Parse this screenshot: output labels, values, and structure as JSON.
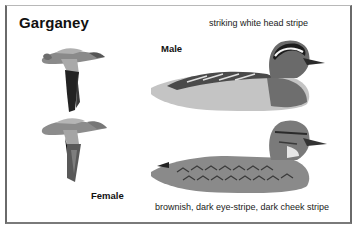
{
  "title": "Garganey",
  "labels": {
    "male": "Male",
    "female": "Female"
  },
  "captions": {
    "male": "striking white head stripe",
    "female": "brownish, dark eye-stripe, dark cheek stripe"
  },
  "illustrations": [
    {
      "id": "male-flying",
      "description": "male garganey in flight"
    },
    {
      "id": "female-flying",
      "description": "female garganey in flight"
    },
    {
      "id": "male-swimming",
      "description": "male garganey on water, side view"
    },
    {
      "id": "female-swimming",
      "description": "female garganey on water, side view"
    }
  ],
  "colors": {
    "border": "#6a6a6a",
    "text": "#111111"
  }
}
